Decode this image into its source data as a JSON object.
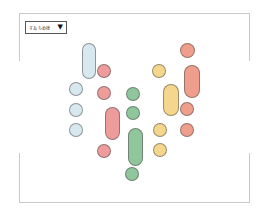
{
  "dropdown": {
    "label": "すあちめ様",
    "arrow": "▼"
  },
  "colors": {
    "blue": "#d8e8f1",
    "red": "#ee9b9b",
    "salmon": "#ee9e8a",
    "green": "#90c69b",
    "yellow": "#f4d68c",
    "frame": "#c9c9c9"
  },
  "shapes": [
    {
      "name": "blue-pill",
      "color": "blue",
      "x": 82,
      "y": 43,
      "w": 14,
      "h": 36
    },
    {
      "name": "red-circle-1",
      "color": "red",
      "x": 97,
      "y": 64,
      "w": 14,
      "h": 14
    },
    {
      "name": "blue-circle-1",
      "color": "blue",
      "x": 69,
      "y": 82,
      "w": 14,
      "h": 14
    },
    {
      "name": "red-circle-2",
      "color": "red",
      "x": 97,
      "y": 86,
      "w": 14,
      "h": 14
    },
    {
      "name": "green-circle-1",
      "color": "green",
      "x": 126,
      "y": 87,
      "w": 14,
      "h": 14
    },
    {
      "name": "blue-circle-2",
      "color": "blue",
      "x": 69,
      "y": 103,
      "w": 14,
      "h": 14
    },
    {
      "name": "green-circle-2",
      "color": "green",
      "x": 126,
      "y": 106,
      "w": 14,
      "h": 14
    },
    {
      "name": "red-pill",
      "color": "red",
      "x": 105,
      "y": 107,
      "w": 15,
      "h": 33
    },
    {
      "name": "blue-circle-3",
      "color": "blue",
      "x": 69,
      "y": 123,
      "w": 14,
      "h": 14
    },
    {
      "name": "green-pill",
      "color": "green",
      "x": 128,
      "y": 128,
      "w": 15,
      "h": 38
    },
    {
      "name": "red-circle-3",
      "color": "red",
      "x": 97,
      "y": 144,
      "w": 14,
      "h": 14
    },
    {
      "name": "green-circle-3",
      "color": "green",
      "x": 125,
      "y": 167,
      "w": 14,
      "h": 14
    },
    {
      "name": "salmon-circle-1",
      "color": "salmon",
      "x": 180,
      "y": 43,
      "w": 15,
      "h": 15
    },
    {
      "name": "yellow-circle-1",
      "color": "yellow",
      "x": 152,
      "y": 64,
      "w": 14,
      "h": 14
    },
    {
      "name": "salmon-pill",
      "color": "salmon",
      "x": 184,
      "y": 65,
      "w": 16,
      "h": 33
    },
    {
      "name": "yellow-pill",
      "color": "yellow",
      "x": 163,
      "y": 84,
      "w": 16,
      "h": 32
    },
    {
      "name": "salmon-circle-2",
      "color": "salmon",
      "x": 180,
      "y": 102,
      "w": 14,
      "h": 14
    },
    {
      "name": "yellow-circle-2",
      "color": "yellow",
      "x": 153,
      "y": 123,
      "w": 14,
      "h": 14
    },
    {
      "name": "salmon-circle-3",
      "color": "salmon",
      "x": 180,
      "y": 123,
      "w": 14,
      "h": 14
    },
    {
      "name": "yellow-circle-3",
      "color": "yellow",
      "x": 153,
      "y": 143,
      "w": 14,
      "h": 14
    }
  ]
}
